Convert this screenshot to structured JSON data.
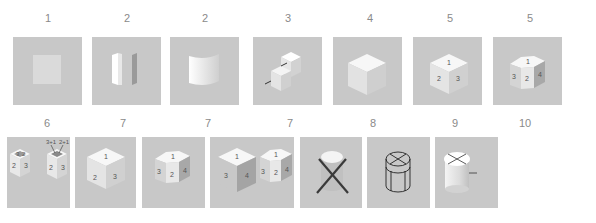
{
  "row1": {
    "labels": [
      "1",
      "2",
      "2",
      "3",
      "4",
      "5",
      "5"
    ],
    "panels": [
      {
        "id": "flat-square-face",
        "description": "single flat square face"
      },
      {
        "id": "two-planes",
        "description": "two separate vertical planes"
      },
      {
        "id": "curved-surface",
        "description": "single curved surface"
      },
      {
        "id": "stepped-block",
        "description": "stepped block with arrows"
      },
      {
        "id": "plain-cube",
        "description": "plain isometric cube"
      },
      {
        "id": "cube-3-faces-numbered",
        "face_labels": [
          "1",
          "2",
          "3"
        ]
      },
      {
        "id": "pentagonal-prism-numbered",
        "face_labels": [
          "1",
          "3",
          "2",
          "4"
        ]
      }
    ]
  },
  "row2": {
    "labels": [
      "6",
      "7",
      "7",
      "7",
      "8",
      "9",
      "10"
    ],
    "panels": [
      {
        "id": "open-boxes",
        "face_labels": [
          "3",
          "2",
          "2",
          "3",
          "2",
          "3"
        ],
        "annotations": [
          "3+1",
          "2+1"
        ]
      },
      {
        "id": "cube-numbered",
        "face_labels": [
          "1",
          "2",
          "3"
        ]
      },
      {
        "id": "pentagonal-prism",
        "face_labels": [
          "1",
          "3",
          "2",
          "4"
        ]
      },
      {
        "id": "cube-and-prism",
        "face_labels": [
          "1",
          "3",
          "4",
          "1",
          "3",
          "2",
          "4"
        ]
      },
      {
        "id": "cylinder-crossed-out",
        "description": "cylinder with large X"
      },
      {
        "id": "cylinder-wireframe",
        "description": "wireframe cylinder with X on top"
      },
      {
        "id": "cylinder-marked",
        "description": "cylinder with X on top and side tick"
      }
    ]
  },
  "colors": {
    "panel_bg": "#c8c8c8",
    "label_text": "#8a8a8a",
    "face_light": "#f2f2f2",
    "face_mid": "#dcdcdc",
    "face_dark": "#b4b4b4",
    "line_dark": "#3a3a3a"
  }
}
